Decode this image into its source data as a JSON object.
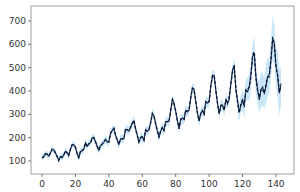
{
  "chart_data": {
    "type": "line",
    "title": "",
    "xlabel": "",
    "ylabel": "",
    "xlim": [
      -7,
      149
    ],
    "ylim": [
      50,
      765
    ],
    "grid": false,
    "legend": null,
    "x_ticks": [
      0,
      20,
      40,
      60,
      80,
      100,
      120,
      140
    ],
    "y_ticks": [
      100,
      200,
      300,
      400,
      500,
      600,
      700
    ],
    "series": [
      {
        "name": "actual",
        "style": "solid",
        "color": "#1f2d4f",
        "values": [
          112,
          118,
          132,
          129,
          121,
          135,
          148,
          148,
          136,
          119,
          104,
          118,
          115,
          126,
          141,
          135,
          125,
          149,
          170,
          170,
          158,
          133,
          114,
          140,
          145,
          150,
          178,
          163,
          172,
          178,
          199,
          199,
          184,
          162,
          146,
          166,
          171,
          180,
          193,
          181,
          183,
          218,
          230,
          242,
          209,
          191,
          172,
          194,
          196,
          196,
          236,
          235,
          229,
          243,
          264,
          272,
          237,
          211,
          180,
          201,
          204,
          188,
          235,
          227,
          234,
          264,
          302,
          293,
          259,
          229,
          203,
          229,
          242,
          233,
          267,
          269,
          270,
          315,
          364,
          347,
          312,
          274,
          237,
          278,
          284,
          277,
          317,
          313,
          318,
          374,
          413,
          405,
          355,
          306,
          271,
          306,
          315,
          301,
          356,
          348,
          355,
          422,
          465,
          467,
          404,
          347,
          305,
          336,
          340,
          318,
          362,
          348,
          363,
          435,
          491,
          505,
          404,
          359,
          310,
          337,
          360,
          342,
          406,
          396,
          420,
          472,
          548,
          559,
          463,
          407,
          362,
          405,
          417,
          391,
          419,
          461,
          472,
          535,
          622,
          606,
          508,
          461,
          390,
          432
        ]
      },
      {
        "name": "predicted",
        "style": "dashed",
        "color": "#1f2d4f",
        "values": [
          112,
          118,
          132,
          129,
          121,
          135,
          148,
          148,
          136,
          119,
          104,
          118,
          115,
          126,
          141,
          135,
          125,
          149,
          170,
          170,
          158,
          133,
          114,
          140,
          145,
          150,
          178,
          163,
          172,
          178,
          199,
          199,
          184,
          162,
          146,
          166,
          171,
          180,
          193,
          181,
          183,
          218,
          230,
          242,
          209,
          191,
          172,
          194,
          196,
          196,
          236,
          235,
          229,
          243,
          264,
          272,
          237,
          211,
          180,
          201,
          204,
          188,
          235,
          227,
          234,
          264,
          302,
          293,
          259,
          229,
          203,
          229,
          242,
          233,
          267,
          269,
          270,
          315,
          364,
          347,
          312,
          274,
          237,
          278,
          284,
          277,
          317,
          313,
          318,
          374,
          413,
          405,
          355,
          306,
          271,
          306,
          315,
          301,
          356,
          348,
          355,
          422,
          465,
          467,
          404,
          347,
          305,
          336,
          340,
          318,
          362,
          348,
          363,
          435,
          491,
          505,
          404,
          359,
          310,
          337,
          360,
          342,
          406,
          396,
          420,
          472,
          548,
          559,
          463,
          407,
          362,
          405,
          417,
          391,
          419,
          461,
          472,
          535,
          622,
          606,
          508,
          461,
          390,
          432
        ]
      }
    ],
    "band": {
      "name": "confidence interval",
      "color": "#9fd3f3",
      "opacity": 0.55,
      "half_width_start": 12,
      "half_width_end_pre": 25,
      "uncertain_from_index": 112,
      "half_width_end": 110
    }
  }
}
